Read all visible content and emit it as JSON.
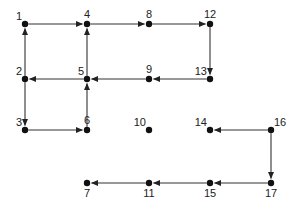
{
  "diagram": {
    "type": "directed-graph",
    "colors": {
      "node": "#111111",
      "edge": "#333333",
      "label": "#222222",
      "background": "#ffffff"
    },
    "nodes": [
      {
        "id": "1",
        "label": "1",
        "col": 0,
        "row": 0,
        "label_pos": "top-left"
      },
      {
        "id": "4",
        "label": "4",
        "col": 1,
        "row": 0,
        "label_pos": "top"
      },
      {
        "id": "8",
        "label": "8",
        "col": 2,
        "row": 0,
        "label_pos": "top"
      },
      {
        "id": "12",
        "label": "12",
        "col": 3,
        "row": 0,
        "label_pos": "top"
      },
      {
        "id": "2",
        "label": "2",
        "col": 0,
        "row": 1,
        "label_pos": "top-left"
      },
      {
        "id": "5",
        "label": "5",
        "col": 1,
        "row": 1,
        "label_pos": "top-left"
      },
      {
        "id": "9",
        "label": "9",
        "col": 2,
        "row": 1,
        "label_pos": "top"
      },
      {
        "id": "13",
        "label": "13",
        "col": 3,
        "row": 1,
        "label_pos": "top-left"
      },
      {
        "id": "3",
        "label": "3",
        "col": 0,
        "row": 2,
        "label_pos": "top-left"
      },
      {
        "id": "6",
        "label": "6",
        "col": 1,
        "row": 2,
        "label_pos": "top"
      },
      {
        "id": "10",
        "label": "10",
        "col": 2,
        "row": 2,
        "label_pos": "top-left"
      },
      {
        "id": "14",
        "label": "14",
        "col": 3,
        "row": 2,
        "label_pos": "top-left"
      },
      {
        "id": "16",
        "label": "16",
        "col": 4,
        "row": 2,
        "label_pos": "top-right"
      },
      {
        "id": "7",
        "label": "7",
        "col": 1,
        "row": 3,
        "label_pos": "bottom"
      },
      {
        "id": "11",
        "label": "11",
        "col": 2,
        "row": 3,
        "label_pos": "bottom"
      },
      {
        "id": "15",
        "label": "15",
        "col": 3,
        "row": 3,
        "label_pos": "bottom"
      },
      {
        "id": "17",
        "label": "17",
        "col": 4,
        "row": 3,
        "label_pos": "bottom"
      }
    ],
    "edges": [
      {
        "from": "1",
        "to": "4"
      },
      {
        "from": "4",
        "to": "8"
      },
      {
        "from": "8",
        "to": "12"
      },
      {
        "from": "12",
        "to": "13"
      },
      {
        "from": "13",
        "to": "9"
      },
      {
        "from": "9",
        "to": "5"
      },
      {
        "from": "5",
        "to": "2"
      },
      {
        "from": "2",
        "to": "1"
      },
      {
        "from": "5",
        "to": "4"
      },
      {
        "from": "2",
        "to": "3"
      },
      {
        "from": "3",
        "to": "6"
      },
      {
        "from": "6",
        "to": "5"
      },
      {
        "from": "16",
        "to": "14"
      },
      {
        "from": "16",
        "to": "17"
      },
      {
        "from": "17",
        "to": "15"
      },
      {
        "from": "15",
        "to": "11"
      },
      {
        "from": "11",
        "to": "7"
      }
    ]
  }
}
